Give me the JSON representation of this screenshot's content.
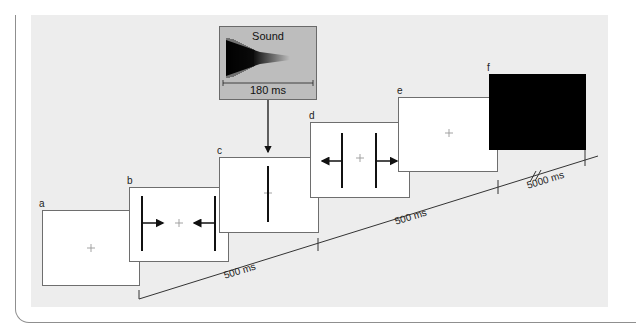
{
  "diagram": {
    "sound": {
      "title": "Sound",
      "duration": "180 ms"
    },
    "screens": [
      {
        "id": "a",
        "label": "a",
        "content": "fixation-cross"
      },
      {
        "id": "b",
        "label": "b",
        "content": "inward-arrows-with-fixation"
      },
      {
        "id": "c",
        "label": "c",
        "content": "single-vertical-line"
      },
      {
        "id": "d",
        "label": "d",
        "content": "outward-arrows-with-fixation"
      },
      {
        "id": "e",
        "label": "e",
        "content": "fixation-cross"
      },
      {
        "id": "f",
        "label": "f",
        "content": "black-screen"
      }
    ],
    "timeline": {
      "segments": [
        "500 ms",
        "500 ms",
        "5000 ms"
      ]
    },
    "colors": {
      "panel": "#ededed",
      "sound_box": "#bdbdbd",
      "line": "#333333"
    }
  }
}
